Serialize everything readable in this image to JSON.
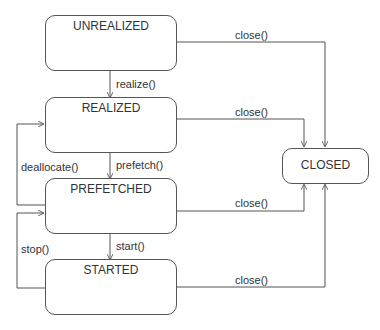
{
  "diagram": {
    "type": "state-diagram",
    "states": [
      {
        "id": "unrealized",
        "label": "UNREALIZED"
      },
      {
        "id": "realized",
        "label": "REALIZED"
      },
      {
        "id": "prefetched",
        "label": "PREFETCHED"
      },
      {
        "id": "started",
        "label": "STARTED"
      },
      {
        "id": "closed",
        "label": "CLOSED"
      }
    ],
    "transitions": [
      {
        "from": "unrealized",
        "to": "realized",
        "label": "realize()"
      },
      {
        "from": "realized",
        "to": "prefetched",
        "label": "prefetch()"
      },
      {
        "from": "prefetched",
        "to": "realized",
        "label": "deallocate()"
      },
      {
        "from": "prefetched",
        "to": "started",
        "label": "start()"
      },
      {
        "from": "started",
        "to": "prefetched",
        "label": "stop()"
      },
      {
        "from": "unrealized",
        "to": "closed",
        "label": "close()"
      },
      {
        "from": "realized",
        "to": "closed",
        "label": "close()"
      },
      {
        "from": "prefetched",
        "to": "closed",
        "label": "close()"
      },
      {
        "from": "started",
        "to": "closed",
        "label": "close()"
      }
    ]
  }
}
